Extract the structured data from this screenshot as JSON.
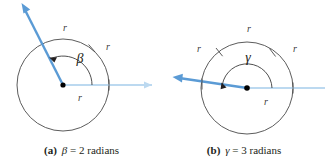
{
  "figure": {
    "background_color": "#ffffff",
    "ray_color": "#5b9bd5",
    "initial_ray_color": "#bcd9f0",
    "circle_color": "#4a4a4a",
    "arc_color": "#3b3b3b",
    "text_color": "#231f20"
  },
  "panels": [
    {
      "id": "a",
      "tag": "(a)",
      "symbol": "β",
      "caption_rest": "= 2 radians",
      "angle_label": "β",
      "angle_radians": 2,
      "center": {
        "x": 63,
        "y": 85
      },
      "radius": 46,
      "radius_labels": [
        "r",
        "r",
        "r"
      ],
      "arc_ticks": 1,
      "terminal_ray_label": "terminal-ray",
      "initial_ray_label": "initial-ray"
    },
    {
      "id": "b",
      "tag": "(b)",
      "symbol": "γ",
      "caption_rest": "= 3 radians",
      "angle_label": "γ",
      "angle_radians": 3,
      "center": {
        "x": 84,
        "y": 88
      },
      "radius": 46,
      "inner_radius": 25,
      "radius_labels": [
        "r",
        "r",
        "r",
        "r"
      ],
      "arc_ticks": 2,
      "terminal_ray_label": "terminal-ray",
      "initial_ray_label": "initial-ray"
    }
  ]
}
